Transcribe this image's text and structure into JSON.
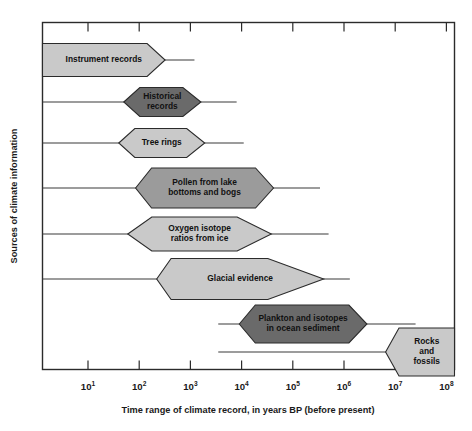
{
  "figure": {
    "title": "",
    "background": "#ffffff",
    "frame_color": "#2b2b2b"
  },
  "palette": {
    "light": "#c9c9c9",
    "medium": "#9b9b9b",
    "dark": "#6a6a6a",
    "outline": "#2b2b2b",
    "text": "#111111"
  },
  "axes": {
    "x_title": "Time range of climate record, in years BP (before present)",
    "y_title": "Sources of climate information",
    "x_tick_labels": [
      {
        "mantissa": "10",
        "exponent": "1"
      },
      {
        "mantissa": "10",
        "exponent": "2"
      },
      {
        "mantissa": "10",
        "exponent": "3"
      },
      {
        "mantissa": "10",
        "exponent": "4"
      },
      {
        "mantissa": "10",
        "exponent": "5"
      },
      {
        "mantissa": "10",
        "exponent": "6"
      },
      {
        "mantissa": "10",
        "exponent": "7"
      },
      {
        "mantissa": "10",
        "exponent": "8"
      }
    ]
  },
  "chart_data": {
    "type": "bar",
    "subtype": "horizontal-range-lens",
    "xlabel": "Time range of climate record, in years BP (before present)",
    "ylabel": "Sources of climate information",
    "xscale": "log10",
    "xlim": [
      1,
      100000000
    ],
    "xticks": [
      10,
      100,
      1000,
      10000,
      100000,
      1000000,
      10000000,
      100000000
    ],
    "xticklabels": [
      "10^1",
      "10^2",
      "10^3",
      "10^4",
      "10^5",
      "10^6",
      "10^7",
      "10^8"
    ],
    "grid": false,
    "legend": null,
    "categories": [
      "Instrument records",
      "Historical records",
      "Tree rings",
      "Pollen from lake bottoms and bogs",
      "Oxygen isotope ratios from ice",
      "Glacial evidence",
      "Plankton and isotopes in ocean sediment",
      "Rocks and fossils"
    ],
    "series": [
      {
        "name": "Instrument records",
        "label_lines": [
          "Instrument records"
        ],
        "shade": "light",
        "whisker_min": 1,
        "whisker_max": 1200,
        "core_min": 1,
        "core_max": 320,
        "shape": "right-point-flat-left"
      },
      {
        "name": "Historical records",
        "label_lines": [
          "Historical",
          "records"
        ],
        "shade": "dark",
        "whisker_min": 1,
        "whisker_max": 8000,
        "core_min": 50,
        "core_max": 1600,
        "shape": "hexagon"
      },
      {
        "name": "Tree rings",
        "label_lines": [
          "Tree rings"
        ],
        "shade": "light",
        "whisker_min": 1,
        "whisker_max": 11000,
        "core_min": 40,
        "core_max": 1900,
        "shape": "hexagon"
      },
      {
        "name": "Pollen from lake bottoms and bogs",
        "label_lines": [
          "Pollen from lake",
          "bottoms and bogs"
        ],
        "shade": "medium",
        "whisker_min": 1,
        "whisker_max": 340000,
        "core_min": 85,
        "core_max": 42000,
        "shape": "hexagon"
      },
      {
        "name": "Oxygen isotope ratios from ice",
        "label_lines": [
          "Oxygen isotope",
          "ratios from ice"
        ],
        "shade": "light",
        "whisker_min": 1,
        "whisker_max": 500000,
        "core_min": 60,
        "core_max": 38000,
        "shape": "lens"
      },
      {
        "name": "Glacial evidence",
        "label_lines": [
          "Glacial evidence"
        ],
        "shade": "light",
        "whisker_min": 1,
        "whisker_max": 1300000,
        "core_min": 220,
        "core_max": 400000,
        "shape": "asymmetric-long-right-point"
      },
      {
        "name": "Plankton and isotopes in ocean sediment",
        "label_lines": [
          "Plankton and isotopes",
          "in ocean sediment"
        ],
        "shade": "dark",
        "whisker_min": 3500,
        "whisker_max": 25000000,
        "core_min": 9000,
        "core_max": 2800000,
        "shape": "hexagon"
      },
      {
        "name": "Rocks and fossils",
        "label_lines": [
          "Rocks",
          "and",
          "fossils"
        ],
        "shade": "light",
        "whisker_min": 3500,
        "whisker_max": 100000000,
        "core_min": 6500000,
        "core_max": 100000000,
        "shape": "left-point-open-right"
      }
    ]
  }
}
